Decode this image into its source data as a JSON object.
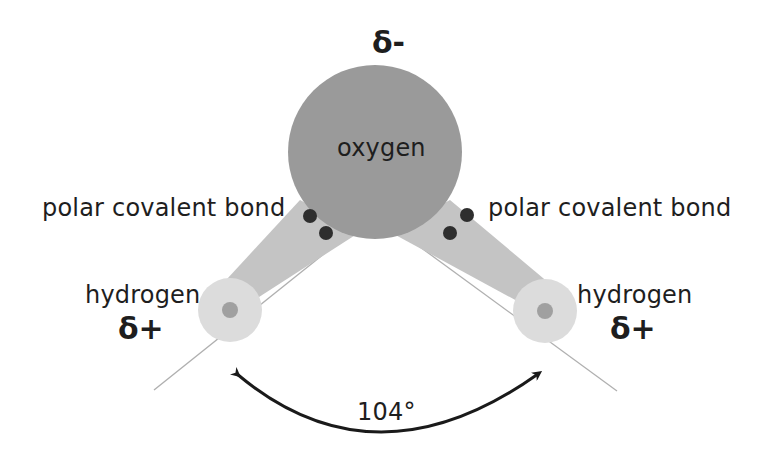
{
  "diagram": {
    "atoms": {
      "oxygen": {
        "label": "oxygen",
        "charge": "δ-",
        "color": "#9a9a9a"
      },
      "hydrogen_left": {
        "label": "hydrogen",
        "charge": "δ+",
        "color": "#dcdcdc",
        "nucleus_color": "#a0a0a0"
      },
      "hydrogen_right": {
        "label": "hydrogen",
        "charge": "δ+",
        "color": "#dcdcdc",
        "nucleus_color": "#a0a0a0"
      }
    },
    "bonds": {
      "left": {
        "label": "polar covalent bond",
        "color": "#c4c4c4",
        "electron_color": "#2e2e2e"
      },
      "right": {
        "label": "polar covalent bond",
        "color": "#c4c4c4",
        "electron_color": "#2e2e2e"
      }
    },
    "angle": {
      "label": "104°"
    }
  }
}
